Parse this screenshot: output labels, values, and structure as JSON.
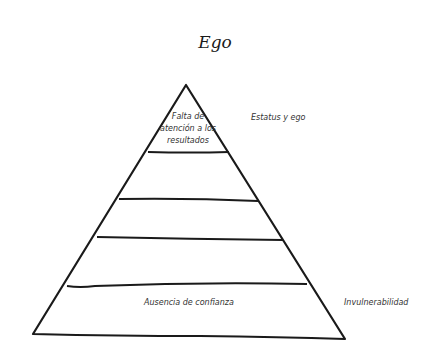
{
  "title": "Ego",
  "diagram": {
    "type": "pyramid",
    "tiers_count": 5,
    "tiers": [
      {
        "level": 1,
        "position": "top",
        "label": "Falta de atención a los resultados",
        "side_label": "Estatus y ego"
      },
      {
        "level": 2,
        "label": "",
        "side_label": ""
      },
      {
        "level": 3,
        "label": "",
        "side_label": ""
      },
      {
        "level": 4,
        "label": "",
        "side_label": ""
      },
      {
        "level": 5,
        "position": "bottom",
        "label": "Ausencia de confianza",
        "side_label": "Invulnerabilidad"
      }
    ],
    "top_tier_label": "Falta de atención a los resultados",
    "top_side_label": "Estatus y ego",
    "bottom_tier_label": "Ausencia de confianza",
    "bottom_side_label": "Invulnerabilidad",
    "line_color": "#1a1a1a",
    "background_color": "#ffffff"
  }
}
